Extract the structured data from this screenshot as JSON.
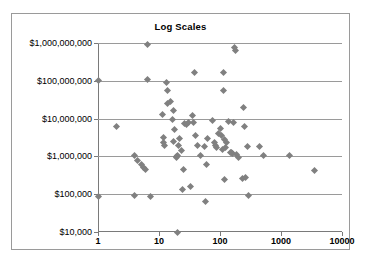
{
  "chart_data": {
    "type": "scatter",
    "title": "Log Scales",
    "xlabel": "",
    "ylabel": "",
    "xscale": "log",
    "yscale": "log",
    "xlim": [
      1,
      10000
    ],
    "ylim": [
      10000,
      1000000000
    ],
    "grid": true,
    "grid_axis": "y",
    "legend": false,
    "marker": "diamond",
    "marker_color": "#808080",
    "x_tick_labels": [
      "1",
      "10",
      "100",
      "1000",
      "10000"
    ],
    "x_ticks": [
      1,
      10,
      100,
      1000,
      10000
    ],
    "y_tick_labels": [
      "$10,000",
      "$100,000",
      "$1,000,000",
      "$10,000,000",
      "$100,000,000",
      "$1,000,000,000"
    ],
    "y_ticks": [
      10000,
      100000,
      1000000,
      10000000,
      100000000,
      1000000000
    ],
    "points": [
      [
        1,
        100000000
      ],
      [
        1,
        85000
      ],
      [
        2,
        6000000
      ],
      [
        3.9,
        1050000
      ],
      [
        4,
        95000
      ],
      [
        4.4,
        800000
      ],
      [
        5.2,
        600000
      ],
      [
        5.6,
        520000
      ],
      [
        6,
        450000
      ],
      [
        6.6,
        900000000
      ],
      [
        6.6,
        110000000
      ],
      [
        7.3,
        85000
      ],
      [
        11.5,
        13000000
      ],
      [
        11.8,
        3200000
      ],
      [
        12,
        2300000
      ],
      [
        12.3,
        1900000
      ],
      [
        13.5,
        90000000
      ],
      [
        13.8,
        55000000
      ],
      [
        14,
        25000000
      ],
      [
        15.5,
        28000000
      ],
      [
        16.5,
        9500000
      ],
      [
        17,
        16000000
      ],
      [
        17.5,
        2500000
      ],
      [
        18,
        5000000
      ],
      [
        19,
        1000000
      ],
      [
        19.5,
        950000
      ],
      [
        20,
        1050000
      ],
      [
        20,
        10000
      ],
      [
        21,
        2000000
      ],
      [
        22,
        3000000
      ],
      [
        23,
        1400000
      ],
      [
        24,
        130000
      ],
      [
        25,
        450000
      ],
      [
        26,
        7500000
      ],
      [
        28,
        7000000
      ],
      [
        30,
        7800000
      ],
      [
        33,
        160000
      ],
      [
        36,
        12000000
      ],
      [
        37,
        8000000
      ],
      [
        38,
        170000000
      ],
      [
        40,
        3500000
      ],
      [
        42,
        2000000
      ],
      [
        48,
        1050000
      ],
      [
        55,
        1800000
      ],
      [
        58,
        65000
      ],
      [
        60,
        600000
      ],
      [
        62,
        3000000
      ],
      [
        75,
        9000000
      ],
      [
        80,
        2300000
      ],
      [
        85,
        2000000
      ],
      [
        88,
        1700000
      ],
      [
        95,
        4000000
      ],
      [
        100,
        5500000
      ],
      [
        105,
        3500000
      ],
      [
        110,
        1500000
      ],
      [
        112,
        170000000
      ],
      [
        115,
        55000000
      ],
      [
        118,
        2800000
      ],
      [
        120,
        250000
      ],
      [
        125,
        1700000
      ],
      [
        130,
        2400000
      ],
      [
        140,
        8500000
      ],
      [
        150,
        1300000
      ],
      [
        155,
        1250000
      ],
      [
        160,
        1200000
      ],
      [
        165,
        8000000
      ],
      [
        175,
        750000000
      ],
      [
        180,
        620000000
      ],
      [
        185,
        1100000
      ],
      [
        200,
        950000
      ],
      [
        230,
        260000
      ],
      [
        240,
        20000000
      ],
      [
        250,
        6000000
      ],
      [
        265,
        280000
      ],
      [
        280,
        1800000
      ],
      [
        290,
        95000
      ],
      [
        450,
        1800000
      ],
      [
        520,
        1050000
      ],
      [
        1400,
        1050000
      ],
      [
        3500,
        430000
      ]
    ]
  }
}
